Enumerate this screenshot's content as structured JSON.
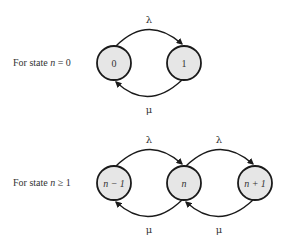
{
  "diagram": {
    "rows": [
      {
        "label_prefix": "For state ",
        "label_var": "n",
        "label_suffix": " = 0",
        "nodes": [
          "0",
          "1"
        ],
        "arrival_rate": "λ",
        "service_rate": "μ"
      },
      {
        "label_prefix": "For state ",
        "label_var": "n",
        "label_suffix": " ≥ 1",
        "nodes": [
          "n − 1",
          "n",
          "n + 1"
        ],
        "arrival_rates": [
          "λ",
          "λ"
        ],
        "service_rates": [
          "μ",
          "μ"
        ]
      }
    ],
    "colors": {
      "node_fill": "#e6e6e6",
      "stroke": "#1a1a1a",
      "text": "#333333"
    }
  }
}
